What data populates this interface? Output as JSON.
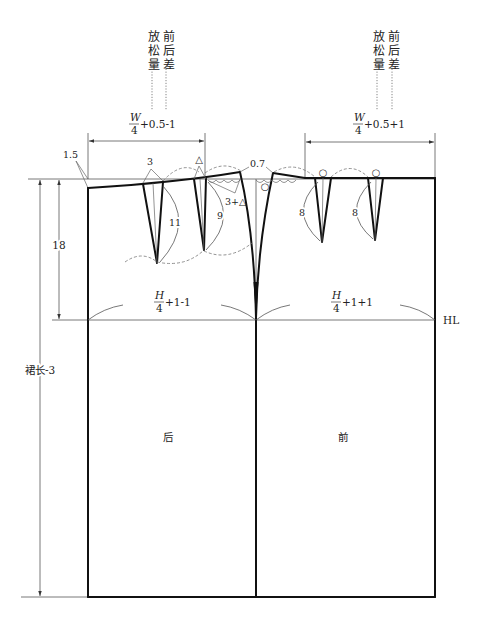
{
  "top_annotations": {
    "back": {
      "ease": "放松量",
      "front_back_diff": "前后差"
    },
    "front": {
      "ease": "放松量",
      "front_back_diff": "前后差"
    }
  },
  "waist_formulas": {
    "back": {
      "numerator": "W",
      "denominator": "4",
      "suffix": "+0.5-1"
    },
    "front": {
      "numerator": "W",
      "denominator": "4",
      "suffix": "+0.5+1"
    }
  },
  "hip_formulas": {
    "back": {
      "numerator": "H",
      "denominator": "4",
      "suffix": "+1-1"
    },
    "front": {
      "numerator": "H",
      "denominator": "4",
      "suffix": "+1+1"
    }
  },
  "measurements": {
    "waist_drop": "1.5",
    "hip_depth": "18",
    "skirt_length": "裙长-3",
    "back_dart_1_width": "3",
    "back_dart_2_width": "△",
    "side_intake": "3+△",
    "side_raise": "0.7",
    "back_dart_1_length": "11",
    "back_dart_2_length": "9",
    "front_dart_1_length": "8",
    "front_dart_2_length": "8"
  },
  "markers": {
    "side_circle": "○",
    "front_dart_1_circle": "○",
    "front_dart_2_circle": "○"
  },
  "line_labels": {
    "hip_line": "HL"
  },
  "panels": {
    "back": "后",
    "front": "前"
  },
  "colors": {
    "outline": "#111111",
    "guide": "#555555",
    "dashed": "#777777",
    "background": "#ffffff"
  }
}
